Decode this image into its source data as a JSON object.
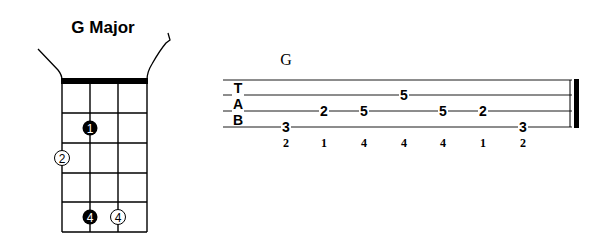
{
  "chord_diagram": {
    "title": "G Major",
    "strings": 4,
    "frets": 5,
    "fingers": [
      {
        "string": 2,
        "fret": 2,
        "label": "1",
        "style": "filled"
      },
      {
        "string": 1,
        "fret": 3,
        "label": "2",
        "style": "open",
        "position": "outside-left"
      },
      {
        "string": 2,
        "fret": 5,
        "label": "4",
        "style": "filled"
      },
      {
        "string": 3,
        "fret": 5,
        "label": "4",
        "style": "open"
      }
    ]
  },
  "tab": {
    "chord_name": "G",
    "clef": [
      "T",
      "A",
      "B"
    ],
    "notes": [
      {
        "fret": "3",
        "line": 4,
        "finger": "2"
      },
      {
        "fret": "2",
        "line": 3,
        "finger": "1"
      },
      {
        "fret": "5",
        "line": 3,
        "finger": "4"
      },
      {
        "fret": "5",
        "line": 2,
        "finger": "4"
      },
      {
        "fret": "5",
        "line": 3,
        "finger": "4"
      },
      {
        "fret": "2",
        "line": 3,
        "finger": "1"
      },
      {
        "fret": "3",
        "line": 4,
        "finger": "2"
      }
    ]
  },
  "colors": {
    "ink": "#000000",
    "background": "#ffffff"
  }
}
